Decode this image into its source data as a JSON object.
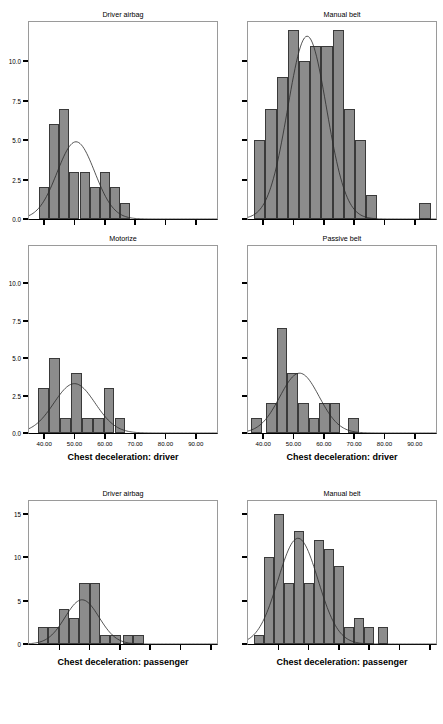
{
  "figure": {
    "type": "histogram-panel-grid",
    "rows": 3,
    "cols": 2,
    "bar_color": "#8c8c8c",
    "bar_edge_color": "#3a3a3a",
    "curve_color": "#2b2b2b",
    "background": "#ffffff"
  },
  "chart_data": [
    {
      "type": "bar",
      "title": "Driver airbag",
      "xlabel": "",
      "ylabel": "Count",
      "position": "row1-left",
      "grid": false,
      "legend": null,
      "ylim": [
        0,
        12.5
      ],
      "yticks": [
        0.0,
        2.5,
        5.0,
        7.5,
        10.0
      ],
      "ytick_labels": [
        "0.0",
        "2.5",
        "5.0",
        "7.5",
        "10.0"
      ],
      "xlim": [
        35,
        97
      ],
      "xticks": [
        40,
        50,
        60,
        70,
        80,
        90
      ],
      "xtick_labels": [
        "",
        "",
        "",
        "",
        "",
        ""
      ],
      "bin_width": 3.333,
      "bin_starts": [
        38.3,
        41.7,
        45.0,
        48.3,
        51.7,
        55.0,
        58.3,
        61.7,
        65.0
      ],
      "categories": [
        "38.3",
        "41.7",
        "45.0",
        "48.3",
        "51.7",
        "55.0",
        "58.3",
        "61.7",
        "65.0"
      ],
      "values": [
        2,
        6,
        7,
        3,
        3,
        2,
        3,
        2,
        1
      ],
      "normal_curve": {
        "mean": 50.5,
        "sd": 6.2,
        "peak": 4.9
      }
    },
    {
      "type": "bar",
      "title": "Manual belt",
      "xlabel": "",
      "ylabel": "",
      "position": "row1-right",
      "grid": false,
      "legend": null,
      "ylim": [
        0,
        12.5
      ],
      "yticks": [
        0.0,
        2.5,
        5.0,
        7.5,
        10.0
      ],
      "ytick_labels": [
        "",
        "",
        "",
        "",
        ""
      ],
      "xlim": [
        35,
        97
      ],
      "xticks": [
        40,
        50,
        60,
        70,
        80,
        90
      ],
      "xtick_labels": [
        "",
        "",
        "",
        "",
        "",
        ""
      ],
      "bin_width": 3.7,
      "bin_starts": [
        37.0,
        40.7,
        44.4,
        48.1,
        51.8,
        55.5,
        59.2,
        62.9,
        66.6,
        70.3,
        74.0,
        88.8
      ],
      "categories": [
        "37.0",
        "40.7",
        "44.4",
        "48.1",
        "51.8",
        "55.5",
        "59.2",
        "62.9",
        "66.6",
        "70.3",
        "74.0",
        "88.8"
      ],
      "values": [
        5,
        7,
        9,
        12,
        10,
        11,
        11,
        12,
        7,
        5,
        1.5,
        0
      ],
      "extra_bar": {
        "x": 91.5,
        "value": 1
      },
      "normal_curve": {
        "mean": 54.5,
        "sd": 6.4,
        "peak": 11.6
      }
    },
    {
      "type": "bar",
      "title": "Motorize",
      "xlabel": "Chest deceleration: driver",
      "ylabel": "Count",
      "position": "row2-left",
      "grid": false,
      "legend": null,
      "ylim": [
        0,
        12.5
      ],
      "yticks": [
        0.0,
        2.5,
        5.0,
        7.5,
        10.0
      ],
      "ytick_labels": [
        "0.0",
        "2.5",
        "5.0",
        "7.5",
        "10.0"
      ],
      "xlim": [
        35,
        97
      ],
      "xticks": [
        40,
        50,
        60,
        70,
        80,
        90
      ],
      "xtick_labels": [
        "40.00",
        "50.00",
        "60.00",
        "70.00",
        "80.00",
        "90.00"
      ],
      "bin_width": 3.6,
      "bin_starts": [
        38.0,
        41.6,
        45.2,
        48.8,
        52.4,
        56.0,
        59.6,
        63.2
      ],
      "categories": [
        "38.0",
        "41.6",
        "45.2",
        "48.8",
        "52.4",
        "56.0",
        "59.6",
        "63.2"
      ],
      "values": [
        3,
        5,
        1,
        4,
        1,
        1,
        3,
        1
      ],
      "normal_curve": {
        "mean": 50.0,
        "sd": 6.8,
        "peak": 3.3
      }
    },
    {
      "type": "bar",
      "title": "Passive belt",
      "xlabel": "Chest deceleration: driver",
      "ylabel": "",
      "position": "row2-right",
      "grid": false,
      "legend": null,
      "ylim": [
        0,
        12.5
      ],
      "yticks": [
        0.0,
        2.5,
        5.0,
        7.5,
        10.0
      ],
      "ytick_labels": [
        "",
        "",
        "",
        "",
        ""
      ],
      "xlim": [
        35,
        97
      ],
      "xticks": [
        40,
        50,
        60,
        70,
        80,
        90
      ],
      "xtick_labels": [
        "40.00",
        "50.00",
        "60.00",
        "70.00",
        "80.00",
        "90.00"
      ],
      "bin_width": 3.5,
      "bin_starts": [
        36.0,
        41.0,
        44.5,
        48.0,
        51.5,
        55.0,
        58.5,
        62.0,
        68.0
      ],
      "categories": [
        "36.0",
        "41.0",
        "44.5",
        "48.0",
        "51.5",
        "55.0",
        "58.5",
        "62.0",
        "68.0"
      ],
      "values": [
        1,
        2,
        7,
        4,
        2,
        1,
        2,
        2,
        1
      ],
      "normal_curve": {
        "mean": 52.0,
        "sd": 6.5,
        "peak": 4.0
      }
    },
    {
      "type": "bar",
      "title": "Driver airbag",
      "xlabel": "Chest deceleration: passenger",
      "ylabel": "Count",
      "position": "row3-left",
      "grid": false,
      "legend": null,
      "ylim": [
        0,
        16.5
      ],
      "yticks": [
        0,
        5,
        10,
        15
      ],
      "ytick_labels": [
        "0",
        "5",
        "10",
        "15"
      ],
      "xlim": [
        35,
        97
      ],
      "xticks": [
        45,
        55,
        65,
        75,
        85,
        95
      ],
      "xtick_labels": [
        "",
        "",
        "",
        "",
        "",
        ""
      ],
      "bin_width": 3.4,
      "bin_starts": [
        38.0,
        41.4,
        44.8,
        48.2,
        51.6,
        55.0,
        58.4,
        61.8,
        66.0,
        69.4
      ],
      "categories": [
        "38.0",
        "41.4",
        "44.8",
        "48.2",
        "51.6",
        "55.0",
        "58.4",
        "61.8",
        "66.0",
        "69.4"
      ],
      "values": [
        2,
        2,
        4,
        3,
        7,
        7,
        1,
        1,
        1,
        1
      ],
      "normal_curve": {
        "mean": 52.5,
        "sd": 5.6,
        "peak": 5.1
      }
    },
    {
      "type": "bar",
      "title": "Manual belt",
      "xlabel": "Chest deceleration: passenger",
      "ylabel": "",
      "position": "row3-right",
      "grid": false,
      "legend": null,
      "ylim": [
        0,
        16.5
      ],
      "yticks": [
        0,
        5,
        10,
        15
      ],
      "ytick_labels": [
        "",
        "",
        "",
        ""
      ],
      "xlim": [
        35,
        97
      ],
      "xticks": [
        45,
        55,
        65,
        75,
        85,
        95
      ],
      "xtick_labels": [
        "",
        "",
        "",
        "",
        "",
        ""
      ],
      "bin_width": 3.3,
      "bin_starts": [
        37.0,
        40.3,
        43.6,
        46.9,
        50.2,
        53.5,
        56.8,
        60.1,
        63.4,
        66.7,
        70.0,
        73.3,
        78.0
      ],
      "categories": [
        "37.0",
        "40.3",
        "43.6",
        "46.9",
        "50.2",
        "53.5",
        "56.8",
        "60.1",
        "63.4",
        "66.7",
        "70.0",
        "73.3",
        "78.0"
      ],
      "values": [
        1,
        10,
        15,
        7,
        13,
        7,
        12,
        11,
        9,
        2,
        3,
        2,
        2
      ],
      "normal_curve": {
        "mean": 51.5,
        "sd": 6.6,
        "peak": 12.2
      }
    }
  ]
}
